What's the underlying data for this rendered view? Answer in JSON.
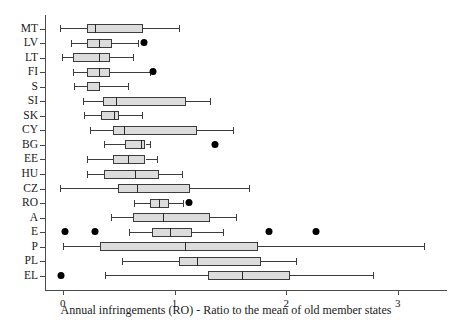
{
  "chart_data": {
    "type": "box",
    "title": "",
    "xlabel": "Annual infringements (RO) - Ratio to the mean of old member states",
    "ylabel": "",
    "orientation": "horizontal",
    "xlim": [
      -0.16,
      3.44
    ],
    "xticks": [
      0,
      1,
      2,
      3
    ],
    "xticklabels": [
      "0",
      "1",
      "2",
      "3"
    ],
    "grid": false,
    "legend": null,
    "categories": [
      "MT",
      "LV",
      "LT",
      "FI",
      "S",
      "SI",
      "SK",
      "CY",
      "BG",
      "EE",
      "HU",
      "CZ",
      "RO",
      "A",
      "E",
      "P",
      "PL",
      "EL"
    ],
    "boxes": [
      {
        "label": "MT",
        "whisker_low": -0.03,
        "q1": 0.22,
        "median": 0.29,
        "q3": 0.72,
        "whisker_high": 1.04,
        "outliers": []
      },
      {
        "label": "LV",
        "whisker_low": 0.07,
        "q1": 0.22,
        "median": 0.32,
        "q3": 0.44,
        "whisker_high": 0.67,
        "outliers": [
          0.73
        ]
      },
      {
        "label": "LT",
        "whisker_low": -0.01,
        "q1": 0.09,
        "median": 0.32,
        "q3": 0.42,
        "whisker_high": 0.63,
        "outliers": []
      },
      {
        "label": "FI",
        "whisker_low": 0.09,
        "q1": 0.22,
        "median": 0.32,
        "q3": 0.42,
        "whisker_high": 0.78,
        "outliers": [
          0.81
        ]
      },
      {
        "label": "S",
        "whisker_low": 0.1,
        "q1": 0.22,
        "median": 0.32,
        "q3": 0.33,
        "whisker_high": 0.58,
        "outliers": []
      },
      {
        "label": "SI",
        "whisker_low": 0.18,
        "q1": 0.36,
        "median": 0.48,
        "q3": 1.1,
        "whisker_high": 1.32,
        "outliers": []
      },
      {
        "label": "SK",
        "whisker_low": 0.19,
        "q1": 0.34,
        "median": 0.46,
        "q3": 0.5,
        "whisker_high": 0.71,
        "outliers": []
      },
      {
        "label": "CY",
        "whisker_low": 0.24,
        "q1": 0.45,
        "median": 0.55,
        "q3": 1.2,
        "whisker_high": 1.52,
        "outliers": []
      },
      {
        "label": "BG",
        "whisker_low": 0.37,
        "q1": 0.56,
        "median": 0.7,
        "q3": 0.74,
        "whisker_high": 0.78,
        "outliers": [
          1.36
        ]
      },
      {
        "label": "EE",
        "whisker_low": 0.22,
        "q1": 0.45,
        "median": 0.58,
        "q3": 0.74,
        "whisker_high": 0.84,
        "outliers": []
      },
      {
        "label": "HU",
        "whisker_low": 0.22,
        "q1": 0.37,
        "median": 0.65,
        "q3": 0.86,
        "whisker_high": 1.07,
        "outliers": []
      },
      {
        "label": "CZ",
        "whisker_low": -0.03,
        "q1": 0.49,
        "median": 0.66,
        "q3": 1.14,
        "whisker_high": 1.67,
        "outliers": []
      },
      {
        "label": "RO",
        "whisker_low": 0.64,
        "q1": 0.78,
        "median": 0.86,
        "q3": 0.95,
        "whisker_high": 1.08,
        "outliers": [
          1.13
        ]
      },
      {
        "label": "A",
        "whisker_low": 0.43,
        "q1": 0.63,
        "median": 0.9,
        "q3": 1.32,
        "whisker_high": 1.55,
        "outliers": []
      },
      {
        "label": "E",
        "whisker_low": 0.59,
        "q1": 0.8,
        "median": 0.96,
        "q3": 1.16,
        "whisker_high": 1.43,
        "outliers": [
          0.02,
          0.29,
          1.85,
          2.27
        ]
      },
      {
        "label": "P",
        "whisker_low": 0.0,
        "q1": 0.33,
        "median": 1.09,
        "q3": 1.75,
        "whisker_high": 3.23,
        "outliers": []
      },
      {
        "label": "PL",
        "whisker_low": 0.53,
        "q1": 1.04,
        "median": 1.2,
        "q3": 1.77,
        "whisker_high": 2.09,
        "outliers": []
      },
      {
        "label": "EL",
        "whisker_low": 0.38,
        "q1": 1.3,
        "median": 1.6,
        "q3": 2.03,
        "whisker_high": 2.78,
        "outliers": [
          -0.02
        ]
      }
    ]
  },
  "colors": {
    "box_fill": "#dcdcdc",
    "box_edge": "#3c3c3c",
    "outlier": "#000000",
    "axis": "#4a4a4a",
    "text": "#1a1a1a"
  }
}
